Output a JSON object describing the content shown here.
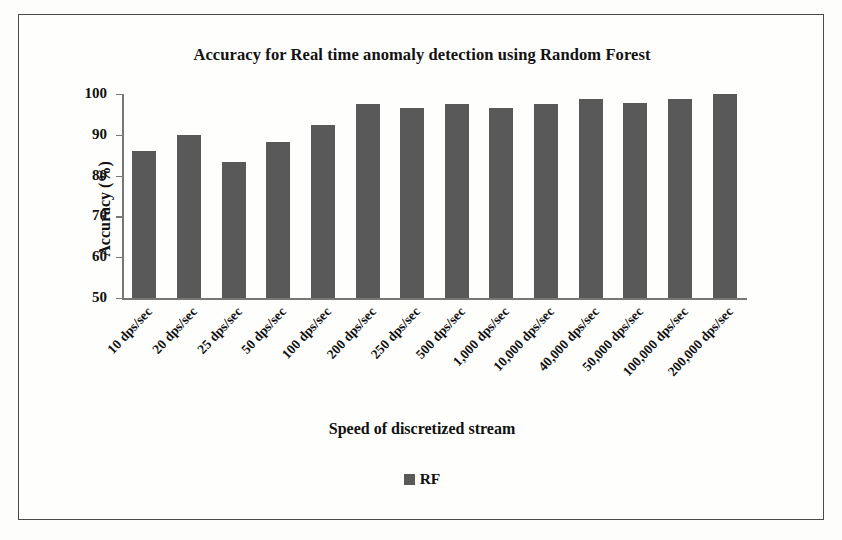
{
  "figure": {
    "background_color": "#fdfdfb",
    "border_color": "#4a4a4a"
  },
  "chart_data": {
    "type": "bar",
    "title": "Accuracy for Real time anomaly detection using Random Forest",
    "xlabel": "Speed of discretized stream",
    "ylabel": "Accuracy (%)",
    "ylim": [
      50,
      100
    ],
    "ytick_labels": [
      "100",
      "90",
      "80",
      "70",
      "60",
      "50"
    ],
    "yticks": [
      100,
      90,
      80,
      70,
      60,
      50
    ],
    "grid": false,
    "legend_position": "bottom",
    "bar_color": "#595959",
    "categories": [
      "10 dps/sec",
      "20 dps/sec",
      "25 dps/sec",
      "50 dps/sec",
      "100 dps/sec",
      "200 dps/sec",
      "250 dps/sec",
      "500 dps/sec",
      "1,000 dps/sec",
      "10,000 dps/sec",
      "40,000 dps/sec",
      "50,000 dps/sec",
      "100,000 dps/sec",
      "200,000 dps/sec"
    ],
    "series": [
      {
        "name": "RF",
        "color": "#595959",
        "values": [
          86.0,
          90.0,
          83.3,
          88.2,
          92.3,
          97.5,
          96.5,
          97.5,
          96.5,
          97.6,
          98.8,
          97.8,
          98.8,
          100.0
        ]
      }
    ],
    "legend": [
      {
        "label": "RF",
        "color": "#595959",
        "marker": "square"
      }
    ]
  }
}
